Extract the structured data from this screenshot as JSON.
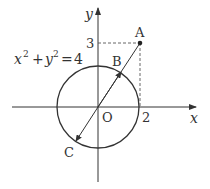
{
  "diagram": {
    "equation": {
      "base_x": "x",
      "exp_x": "2",
      "plus": "+",
      "base_y": "y",
      "exp_y": "2",
      "eq": "=",
      "rhs": "4"
    },
    "axes": {
      "x_label": "x",
      "y_label": "y",
      "origin_label": "O"
    },
    "ticks": {
      "x_tick": "2",
      "y_tick": "3"
    },
    "points": {
      "A": "A",
      "B": "B",
      "C": "C"
    },
    "colors": {
      "stroke": "#333333",
      "dashed": "#555555"
    }
  }
}
